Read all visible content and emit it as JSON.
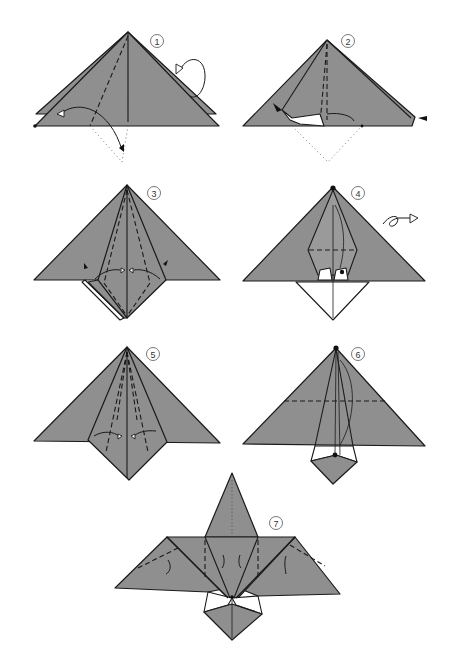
{
  "diagram": {
    "type": "origami instructions",
    "colors": {
      "paper": "#8f8f8f",
      "outline": "#1a1a1a",
      "background": "#ffffff",
      "reverse_side": "#ffffff"
    },
    "steps": [
      {
        "number": "1",
        "description": "Valley-fold near flap bottom corner up along dashed line; fold behind at right (loop arrow)",
        "symbols": [
          "valley-fold-line",
          "fold-arrow",
          "turn-behind-loop-arrow",
          "x-ray-dotted-outline"
        ]
      },
      {
        "number": "2",
        "description": "Squash/open pocket; push-in arrows at left and right edges",
        "symbols": [
          "push-arrow-left",
          "push-arrow-right",
          "fold-arrow",
          "x-ray-dotted-outline"
        ]
      },
      {
        "number": "3",
        "description": "Petal-fold lower diamond; push-in arrows on both sides",
        "symbols": [
          "valley-fold-lines",
          "fold-arrows",
          "push-arrows"
        ]
      },
      {
        "number": "4",
        "description": "Reverse fold; turn model over",
        "symbols": [
          "reference-dot",
          "turn-over-arrow",
          "valley-fold-line"
        ]
      },
      {
        "number": "5",
        "description": "Narrow the center flap by folding edges to center",
        "symbols": [
          "valley-fold-lines",
          "fold-arrows"
        ]
      },
      {
        "number": "6",
        "description": "Fold along horizontal dashed line",
        "symbols": [
          "reference-dot",
          "valley-fold-line"
        ]
      },
      {
        "number": "7",
        "description": "Shape wings with valley folds",
        "symbols": [
          "valley-fold-lines",
          "fold-arrows"
        ]
      }
    ]
  }
}
